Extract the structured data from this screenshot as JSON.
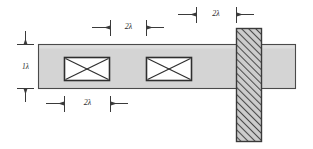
{
  "diagram": {
    "background_color": "#ffffff",
    "line_color": "#3a3a3a",
    "beam": {
      "name": "horizontal-beam",
      "fill_color": "#d4d4d4",
      "stroke_color": "#4a4a4a",
      "x": 38,
      "y": 44,
      "width": 258,
      "height": 45
    },
    "column": {
      "name": "vertical-hatched-column",
      "fill_color": "#c9c9c9",
      "stroke_color": "#3a3a3a",
      "hatch_color": "#4a4a4a",
      "hatch_direction": "bottom-left-to-top-right",
      "x": 236,
      "y": 28,
      "width": 26,
      "height": 114
    },
    "braces": [
      {
        "name": "brace-left",
        "x": 64,
        "y": 57,
        "width": 46,
        "height": 24,
        "fill_color": "#ffffff"
      },
      {
        "name": "brace-right",
        "x": 146,
        "y": 57,
        "width": 46,
        "height": 24,
        "fill_color": "#ffffff"
      }
    ],
    "dimensions": {
      "height_dim": {
        "label": "1λ",
        "orientation": "vertical",
        "x": 25,
        "y_top": 44,
        "y_bottom": 89
      },
      "middle_dim": {
        "label": "2λ",
        "orientation": "horizontal",
        "y": 27,
        "x_left": 110,
        "x_right": 146
      },
      "top_right_dim": {
        "label": "2λ",
        "orientation": "horizontal",
        "y": 14,
        "x_left": 196,
        "x_right": 236
      },
      "bottom_dim": {
        "label": "2λ",
        "orientation": "horizontal",
        "y": 103,
        "x_left": 64,
        "x_right": 110
      }
    }
  }
}
